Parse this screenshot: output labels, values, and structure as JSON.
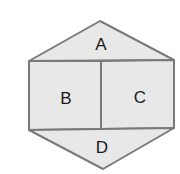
{
  "diagram": {
    "shape": "hexagon",
    "fill_color": "#e8e8e8",
    "stroke_color": "#7a7a7a",
    "background_color": "#ffffff",
    "regions": [
      {
        "id": "A",
        "label": "A",
        "position": "top-triangle"
      },
      {
        "id": "B",
        "label": "B",
        "position": "middle-left-rectangle"
      },
      {
        "id": "C",
        "label": "C",
        "position": "middle-right-rectangle"
      },
      {
        "id": "D",
        "label": "D",
        "position": "bottom-triangle"
      }
    ]
  }
}
